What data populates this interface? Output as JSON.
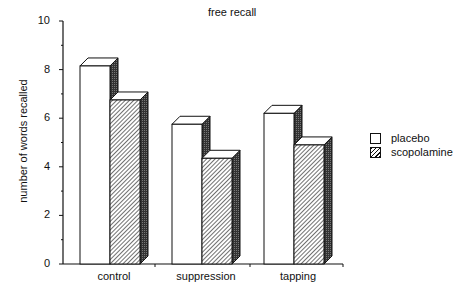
{
  "chart_data": {
    "type": "bar",
    "title": "free recall",
    "xlabel": "",
    "ylabel": "number of words recalled",
    "ylim": [
      0,
      10
    ],
    "yticks": [
      0,
      2,
      4,
      6,
      8,
      10
    ],
    "categories": [
      "control",
      "suppression",
      "tapping"
    ],
    "series": [
      {
        "name": "placebo",
        "values": [
          8.15,
          5.75,
          6.2
        ],
        "pattern": "white"
      },
      {
        "name": "scopolamine",
        "values": [
          6.75,
          4.35,
          4.9
        ],
        "pattern": "diagonal-hatch"
      }
    ],
    "grid": false,
    "legend_position": "right",
    "style": "3d-bar"
  },
  "title": "free recall",
  "ylabel": "number of words recalled",
  "yticks": [
    "0",
    "2",
    "4",
    "6",
    "8",
    "10"
  ],
  "categories": [
    "control",
    "suppression",
    "tapping"
  ],
  "legend": {
    "items": [
      {
        "label": "placebo"
      },
      {
        "label": "scopolamine"
      }
    ]
  }
}
